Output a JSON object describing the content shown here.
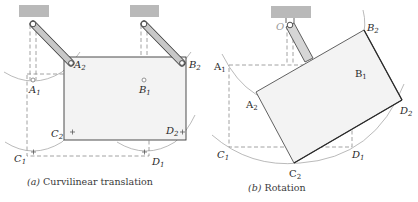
{
  "figure": {
    "panels": [
      {
        "id": "a",
        "caption_letter": "(a)",
        "caption_text": "Curvilinear translation",
        "labels": {
          "A1": {
            "base": "A",
            "sub": "1"
          },
          "A2": {
            "base": "A",
            "sub": "2"
          },
          "B1": {
            "base": "B",
            "sub": "1"
          },
          "B2": {
            "base": "B",
            "sub": "2"
          },
          "C1": {
            "base": "C",
            "sub": "1"
          },
          "C2": {
            "base": "C",
            "sub": "2"
          },
          "D1": {
            "base": "D",
            "sub": "1"
          },
          "D2": {
            "base": "D",
            "sub": "2"
          }
        }
      },
      {
        "id": "b",
        "caption_letter": "(b)",
        "caption_text": "Rotation",
        "labels": {
          "O": {
            "base": "O"
          },
          "A1": {
            "base": "A",
            "sub": "1"
          },
          "A2": {
            "base": "A",
            "sub": "2"
          },
          "B1": {
            "base": "B",
            "sub": "1"
          },
          "B2": {
            "base": "B",
            "sub": "2"
          },
          "C1": {
            "base": "C",
            "sub": "1"
          },
          "C2": {
            "base": "C",
            "sub": "2"
          },
          "D1": {
            "base": "D",
            "sub": "1"
          },
          "D2": {
            "base": "D",
            "sub": "2"
          }
        }
      }
    ],
    "colors": {
      "ground": "#b9b9b9",
      "plate_fill": "#f3f3f3",
      "line": "#3a3a3a",
      "dashed": "#8a8a8a",
      "arc": "#a8a8a8",
      "link": "#c8c8c8"
    }
  }
}
